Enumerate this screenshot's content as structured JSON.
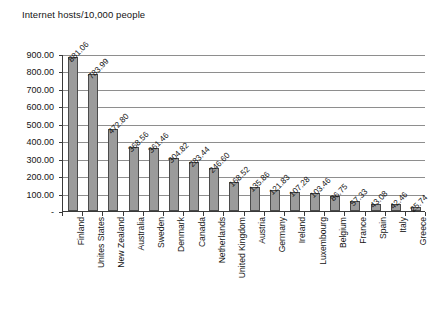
{
  "chart_data": {
    "type": "bar",
    "title": "Internet hosts/10,000 people",
    "xlabel": "",
    "ylabel": "",
    "ylim": [
      0,
      900
    ],
    "ytick_labels": [
      "900.00",
      "800.00",
      "700.00",
      "600.00",
      "500.00",
      "400.00",
      "300.00",
      "200.00",
      "100.00",
      "-"
    ],
    "ytick_values": [
      900,
      800,
      700,
      600,
      500,
      400,
      300,
      200,
      100,
      0
    ],
    "grid": true,
    "legend": "none",
    "bar_fill_color": "#9b9b9b",
    "bar_border_color": "#4a4a4a",
    "categories": [
      "Finland",
      "Unites States",
      "New Zealand",
      "Australia",
      "Sweden",
      "Denmark",
      "Canada",
      "Netherlands",
      "United Kingdom",
      "Austria",
      "Germany",
      "Ireland",
      "Luxembourg",
      "Belgium",
      "France",
      "Spain",
      "Italy",
      "Greece"
    ],
    "values": [
      881.06,
      783.99,
      472.8,
      368.56,
      361.46,
      304.82,
      283.44,
      246.6,
      168.52,
      135.86,
      121.83,
      107.28,
      103.46,
      86.75,
      57.33,
      43.08,
      42.46,
      25.74
    ],
    "data_labels": [
      "881.06",
      "783.99",
      "472.80",
      "368.56",
      "361.46",
      "304.82",
      "283.44",
      "246.60",
      "168.52",
      "135.86",
      "121.83",
      "107.28",
      "103.46",
      "86.75",
      "57.33",
      "43.08",
      "42.46",
      "25.74"
    ]
  }
}
